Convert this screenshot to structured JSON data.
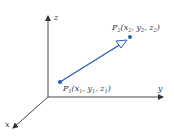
{
  "diagram": {
    "type": "3d-vector",
    "axes": {
      "x_label": "x",
      "y_label": "y",
      "z_label": "z"
    },
    "points": {
      "p1": {
        "name": "P",
        "sub": "1",
        "coords_text": "(x",
        "x_sub": "1",
        "y_text": ", y",
        "y_sub": "1",
        "z_text": ", z",
        "z_sub": "1",
        "close": ")"
      },
      "p2": {
        "name": "P",
        "sub": "2",
        "coords_text": "(x",
        "x_sub": "2",
        "y_text": ", y",
        "y_sub": "2",
        "z_text": ", z",
        "z_sub": "2",
        "close": ")"
      }
    },
    "colors": {
      "axis": "#333333",
      "vector": "#2a5bb5",
      "point": "#2a5bb5"
    }
  }
}
